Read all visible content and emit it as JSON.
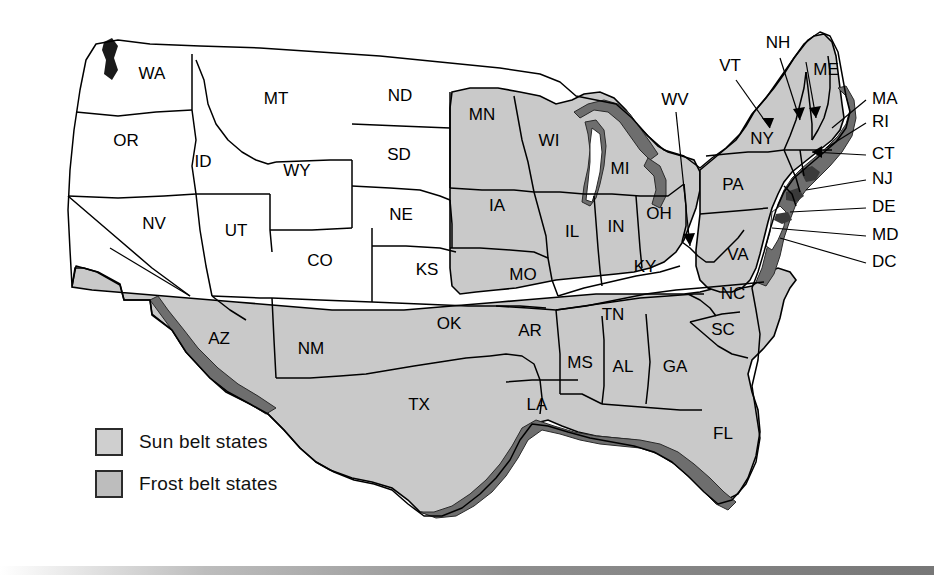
{
  "map": {
    "title": "United States Sun Belt and Frost Belt Map",
    "background_color": "#ffffff",
    "colors": {
      "sun_belt_fill": "#c9c9c9",
      "frost_belt_fill": "#ffffff",
      "shaded_fill": "#c9c9c9",
      "unshaded_fill": "#ffffff",
      "coast_shadow": "#6e6e6e",
      "lake_shadow": "#6e6e6e",
      "outline": "#000000",
      "label_color": "#000000",
      "bottom_bar": "#8e8e8e"
    }
  },
  "legend": {
    "items": [
      {
        "label": "Sun belt states",
        "swatch_color": "#cfcfcf",
        "border_color": "#2b2b2b"
      },
      {
        "label": "Frost belt states",
        "swatch_color": "#bdbdbd",
        "border_color": "#2b2b2b"
      }
    ]
  },
  "state_labels": [
    {
      "code": "WA",
      "x": 152,
      "y": 75,
      "shaded": false
    },
    {
      "code": "OR",
      "x": 126,
      "y": 142,
      "shaded": false
    },
    {
      "code": "ID",
      "x": 203,
      "y": 163,
      "shaded": false
    },
    {
      "code": "MT",
      "x": 276,
      "y": 100,
      "shaded": false
    },
    {
      "code": "WY",
      "x": 297,
      "y": 172,
      "shaded": false
    },
    {
      "code": "NV",
      "x": 154,
      "y": 225,
      "shaded": false
    },
    {
      "code": "UT",
      "x": 236,
      "y": 232,
      "shaded": false
    },
    {
      "code": "CO",
      "x": 320,
      "y": 262,
      "shaded": false
    },
    {
      "code": "ND",
      "x": 400,
      "y": 97,
      "shaded": true
    },
    {
      "code": "SD",
      "x": 399,
      "y": 156,
      "shaded": false
    },
    {
      "code": "NE",
      "x": 401,
      "y": 216,
      "shaded": false
    },
    {
      "code": "KS",
      "x": 427,
      "y": 271,
      "shaded": false
    },
    {
      "code": "MN",
      "x": 482,
      "y": 116,
      "shaded": true
    },
    {
      "code": "IA",
      "x": 497,
      "y": 207,
      "shaded": true
    },
    {
      "code": "MO",
      "x": 523,
      "y": 276,
      "shaded": false
    },
    {
      "code": "WI",
      "x": 549,
      "y": 142,
      "shaded": true
    },
    {
      "code": "IL",
      "x": 572,
      "y": 233,
      "shaded": true
    },
    {
      "code": "MI",
      "x": 620,
      "y": 170,
      "shaded": true
    },
    {
      "code": "IN",
      "x": 616,
      "y": 228,
      "shaded": true
    },
    {
      "code": "OH",
      "x": 659,
      "y": 215,
      "shaded": true
    },
    {
      "code": "KY",
      "x": 645,
      "y": 268,
      "shaded": false
    },
    {
      "code": "AZ",
      "x": 219,
      "y": 340,
      "shaded": true
    },
    {
      "code": "NM",
      "x": 311,
      "y": 350,
      "shaded": true
    },
    {
      "code": "OK",
      "x": 449,
      "y": 325,
      "shaded": true
    },
    {
      "code": "TX",
      "x": 419,
      "y": 406,
      "shaded": true
    },
    {
      "code": "AR",
      "x": 530,
      "y": 332,
      "shaded": true
    },
    {
      "code": "LA",
      "x": 537,
      "y": 406,
      "shaded": true
    },
    {
      "code": "MS",
      "x": 580,
      "y": 364,
      "shaded": true
    },
    {
      "code": "AL",
      "x": 623,
      "y": 368,
      "shaded": true
    },
    {
      "code": "TN",
      "x": 613,
      "y": 316,
      "shaded": true
    },
    {
      "code": "GA",
      "x": 675,
      "y": 368,
      "shaded": true
    },
    {
      "code": "SC",
      "x": 723,
      "y": 331,
      "shaded": true
    },
    {
      "code": "NC",
      "x": 733,
      "y": 295,
      "shaded": true
    },
    {
      "code": "FL",
      "x": 723,
      "y": 435,
      "shaded": true
    },
    {
      "code": "VA",
      "x": 738,
      "y": 256,
      "shaded": true
    },
    {
      "code": "PA",
      "x": 733,
      "y": 186,
      "shaded": true
    },
    {
      "code": "NY",
      "x": 762,
      "y": 140,
      "shaded": true
    },
    {
      "code": "ME",
      "x": 826,
      "y": 71,
      "shaded": true
    }
  ],
  "callout_labels": [
    {
      "code": "VT",
      "x": 730,
      "y": 67,
      "anchor": "middle",
      "shaded": true
    },
    {
      "code": "NH",
      "x": 778,
      "y": 44,
      "anchor": "middle",
      "shaded": true
    },
    {
      "code": "WV",
      "x": 675,
      "y": 101,
      "anchor": "middle",
      "shaded": true
    },
    {
      "code": "MA",
      "x": 872,
      "y": 100,
      "anchor": "start",
      "shaded": true
    },
    {
      "code": "RI",
      "x": 872,
      "y": 123,
      "anchor": "start",
      "shaded": true
    },
    {
      "code": "CT",
      "x": 872,
      "y": 155,
      "anchor": "start",
      "shaded": true
    },
    {
      "code": "NJ",
      "x": 872,
      "y": 180,
      "anchor": "start",
      "shaded": true
    },
    {
      "code": "DE",
      "x": 872,
      "y": 208,
      "anchor": "start",
      "shaded": true
    },
    {
      "code": "MD",
      "x": 872,
      "y": 236,
      "anchor": "start",
      "shaded": true
    },
    {
      "code": "DC",
      "x": 872,
      "y": 263,
      "anchor": "start",
      "shaded": true
    }
  ],
  "bottom_bar": {
    "visible": true
  }
}
